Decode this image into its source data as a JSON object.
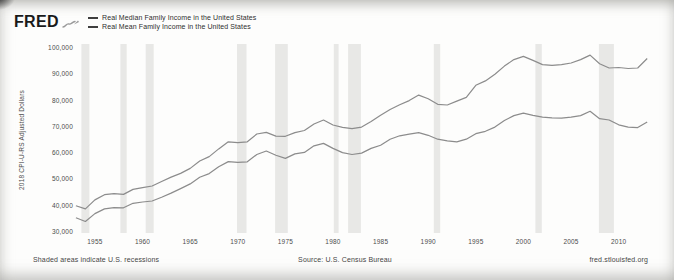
{
  "header": {
    "logo_text": "FRED"
  },
  "footer": {
    "left_note": "Shaded areas indicate U.S. recessions",
    "source": "Source: U.S. Census Bureau",
    "site": "fred.stlouisfed.org"
  },
  "colors": {
    "line": "#8c8c8c",
    "legend_marker": "#3f3f3f",
    "recession_band": "#e8e8e6",
    "text": "#4c4c4c",
    "logo": "#1a1a1a"
  },
  "chart_data": {
    "type": "line",
    "title": "",
    "xlabel": "",
    "ylabel": "2018 CPI-U-RS Adjusted Dollars",
    "grid": false,
    "legend_position": "top-left",
    "xlim": [
      1952.8,
      2013.5
    ],
    "ylim": [
      30000,
      100000
    ],
    "yticks": [
      30000,
      40000,
      50000,
      60000,
      70000,
      80000,
      90000,
      100000
    ],
    "xticks": [
      1955,
      1960,
      1965,
      1970,
      1975,
      1980,
      1985,
      1990,
      1995,
      2000,
      2005,
      2010
    ],
    "x": [
      1953,
      1954,
      1955,
      1956,
      1957,
      1958,
      1959,
      1960,
      1961,
      1962,
      1963,
      1964,
      1965,
      1966,
      1967,
      1968,
      1969,
      1970,
      1971,
      1972,
      1973,
      1974,
      1975,
      1976,
      1977,
      1978,
      1979,
      1980,
      1981,
      1982,
      1983,
      1984,
      1985,
      1986,
      1987,
      1988,
      1989,
      1990,
      1991,
      1992,
      1993,
      1994,
      1995,
      1996,
      1997,
      1998,
      1999,
      2000,
      2001,
      2002,
      2003,
      2004,
      2005,
      2006,
      2007,
      2008,
      2009,
      2010,
      2011,
      2012,
      2013
    ],
    "series": [
      {
        "name": "Real Median Family Income in the United States",
        "values": [
          35400,
          34000,
          37000,
          38800,
          39300,
          39200,
          40900,
          41400,
          41800,
          43200,
          44800,
          46500,
          48300,
          50800,
          52200,
          54800,
          56800,
          56500,
          56700,
          59500,
          60800,
          59200,
          58000,
          59700,
          60300,
          62800,
          63700,
          61800,
          60200,
          59500,
          60000,
          61800,
          63000,
          65300,
          66600,
          67200,
          67800,
          66800,
          65300,
          64700,
          64300,
          65300,
          67400,
          68300,
          69900,
          72400,
          74300,
          75200,
          74400,
          73700,
          73400,
          73300,
          73700,
          74300,
          75900,
          73100,
          72600,
          70800,
          69900,
          69700,
          71900
        ]
      },
      {
        "name": "Real Mean Family Income in the United States",
        "values": [
          40000,
          38800,
          42200,
          44200,
          44600,
          44300,
          46200,
          46900,
          47500,
          49200,
          50900,
          52300,
          54200,
          57000,
          58700,
          61600,
          64300,
          64000,
          64300,
          67300,
          67900,
          66500,
          66400,
          67800,
          68600,
          71100,
          72600,
          70700,
          69800,
          69300,
          69900,
          72000,
          74400,
          76600,
          78400,
          80000,
          82100,
          80700,
          78600,
          78300,
          79800,
          81200,
          85800,
          87500,
          90000,
          93100,
          95600,
          96800,
          95300,
          93700,
          93400,
          93700,
          94300,
          95600,
          97300,
          94000,
          92400,
          92600,
          92200,
          92400,
          96000
        ]
      }
    ],
    "recessions": [
      [
        1953.58,
        1954.42
      ],
      [
        1957.67,
        1958.33
      ],
      [
        1960.33,
        1961.17
      ],
      [
        1969.92,
        1970.92
      ],
      [
        1973.92,
        1975.25
      ],
      [
        1980.08,
        1980.58
      ],
      [
        1981.58,
        1982.92
      ],
      [
        1990.58,
        1991.25
      ],
      [
        2001.25,
        2001.92
      ],
      [
        2007.92,
        2009.5
      ]
    ]
  }
}
